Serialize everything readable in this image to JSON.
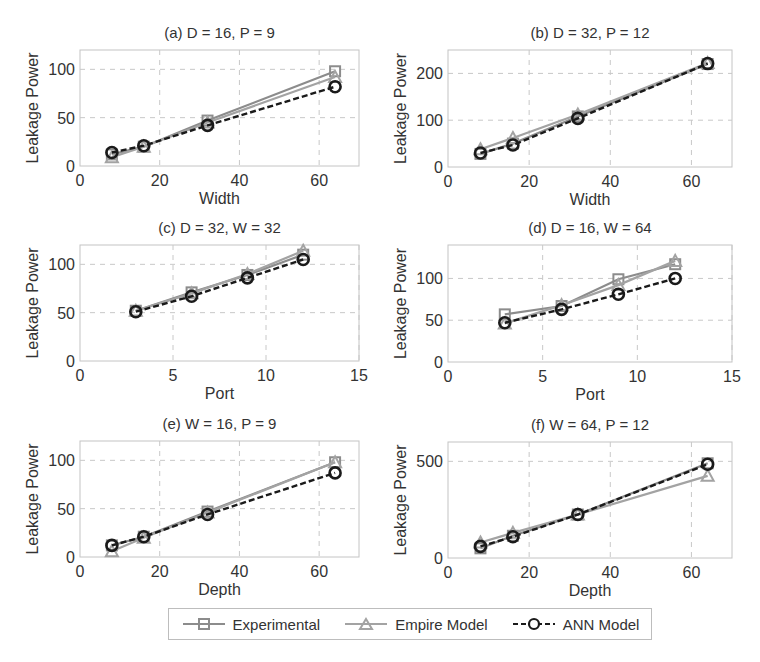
{
  "legend": {
    "items": [
      {
        "label": "Experimental",
        "color": "#8c8c8c",
        "marker": "square",
        "line": "solid"
      },
      {
        "label": "Empire Model",
        "color": "#a3a3a3",
        "marker": "triangle",
        "line": "solid"
      },
      {
        "label": "ANN Model",
        "color": "#1a1a1a",
        "marker": "circle",
        "line": "dashed"
      }
    ]
  },
  "chart_data": [
    {
      "type": "line",
      "title": "(a) D = 16, P = 9",
      "xlabel": "Width",
      "ylabel": "Leakage Power",
      "xlim": [
        0,
        70
      ],
      "ylim": [
        0,
        120
      ],
      "xticks": [
        0,
        20,
        40,
        60
      ],
      "yticks": [
        0,
        50,
        100
      ],
      "grid": true,
      "x": [
        8,
        16,
        32,
        64
      ],
      "series": [
        {
          "name": "Experimental",
          "values": [
            12,
            20,
            47,
            98
          ]
        },
        {
          "name": "Empire Model",
          "values": [
            9,
            20,
            45,
            92
          ]
        },
        {
          "name": "ANN Model",
          "values": [
            14,
            21,
            42,
            82
          ]
        }
      ]
    },
    {
      "type": "line",
      "title": "(b) D = 32, P = 12",
      "xlabel": "Width",
      "ylabel": "Leakage Power",
      "xlim": [
        0,
        70
      ],
      "ylim": [
        0,
        250
      ],
      "xticks": [
        0,
        20,
        40,
        60
      ],
      "yticks": [
        0,
        100,
        200
      ],
      "grid": true,
      "x": [
        8,
        16,
        32,
        64
      ],
      "series": [
        {
          "name": "Experimental",
          "values": [
            28,
            50,
            108,
            220
          ]
        },
        {
          "name": "Empire Model",
          "values": [
            38,
            62,
            112,
            222
          ]
        },
        {
          "name": "ANN Model",
          "values": [
            30,
            47,
            104,
            221
          ]
        }
      ]
    },
    {
      "type": "line",
      "title": "(c) D = 32, W = 32",
      "xlabel": "Port",
      "ylabel": "Leakage Power",
      "xlim": [
        0,
        15
      ],
      "ylim": [
        0,
        120
      ],
      "xticks": [
        0,
        5,
        10,
        15
      ],
      "yticks": [
        0,
        50,
        100
      ],
      "grid": true,
      "x": [
        3,
        6,
        9,
        12
      ],
      "series": [
        {
          "name": "Experimental",
          "values": [
            52,
            71,
            89,
            110
          ]
        },
        {
          "name": "Empire Model",
          "values": [
            52,
            70,
            90,
            114
          ]
        },
        {
          "name": "ANN Model",
          "values": [
            51,
            67,
            86,
            105
          ]
        }
      ]
    },
    {
      "type": "line",
      "title": "(d) D = 16, W = 64",
      "xlabel": "Port",
      "ylabel": "Leakage Power",
      "xlim": [
        0,
        15
      ],
      "ylim": [
        0,
        140
      ],
      "xticks": [
        0,
        5,
        10,
        15
      ],
      "yticks": [
        0,
        50,
        100
      ],
      "grid": true,
      "x": [
        3,
        6,
        9,
        12
      ],
      "series": [
        {
          "name": "Experimental",
          "values": [
            57,
            67,
            99,
            117
          ]
        },
        {
          "name": "Empire Model",
          "values": [
            46,
            68,
            92,
            121
          ]
        },
        {
          "name": "ANN Model",
          "values": [
            47,
            63,
            81,
            100
          ]
        }
      ]
    },
    {
      "type": "line",
      "title": "(e) W = 16, P = 9",
      "xlabel": "Depth",
      "ylabel": "Leakage Power",
      "xlim": [
        0,
        70
      ],
      "ylim": [
        0,
        120
      ],
      "xticks": [
        0,
        20,
        40,
        60
      ],
      "yticks": [
        0,
        50,
        100
      ],
      "grid": true,
      "x": [
        8,
        16,
        32,
        64
      ],
      "series": [
        {
          "name": "Experimental",
          "values": [
            12,
            21,
            47,
            98
          ]
        },
        {
          "name": "Empire Model",
          "values": [
            6,
            20,
            46,
            98
          ]
        },
        {
          "name": "ANN Model",
          "values": [
            12,
            21,
            44,
            87
          ]
        }
      ]
    },
    {
      "type": "line",
      "title": "(f) W = 64, P = 12",
      "xlabel": "Depth",
      "ylabel": "Leakage Power",
      "xlim": [
        0,
        70
      ],
      "ylim": [
        0,
        600
      ],
      "xticks": [
        0,
        20,
        40,
        60
      ],
      "yticks": [
        0,
        500
      ],
      "grid": true,
      "x": [
        8,
        16,
        32,
        64
      ],
      "series": [
        {
          "name": "Experimental",
          "values": [
            50,
            115,
            225,
            490
          ]
        },
        {
          "name": "Empire Model",
          "values": [
            80,
            130,
            225,
            425
          ]
        },
        {
          "name": "ANN Model",
          "values": [
            60,
            110,
            225,
            485
          ]
        }
      ]
    }
  ]
}
